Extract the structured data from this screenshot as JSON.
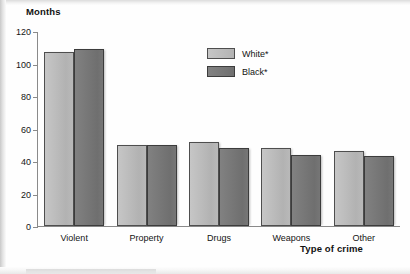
{
  "chart_data": {
    "type": "bar",
    "title": "",
    "subtitle": "",
    "ylabel": "Months",
    "xlabel": "Type of crime",
    "categories": [
      "Violent",
      "Property",
      "Drugs",
      "Weapons",
      "Other"
    ],
    "series": [
      {
        "name": "White*",
        "color": "#b9b9b9",
        "values": [
          107,
          50,
          52,
          48,
          46
        ]
      },
      {
        "name": "Black*",
        "color": "#777777",
        "values": [
          109,
          50,
          48,
          44,
          43
        ]
      }
    ],
    "ylim": [
      0,
      120
    ],
    "ytick_step": 20,
    "yticks": [
      0,
      20,
      40,
      60,
      80,
      100,
      120
    ],
    "ytick_labels": [
      "0",
      "20",
      "40",
      "60",
      "80",
      "100",
      "120"
    ],
    "grid": false,
    "legend_position": "inside-top-center"
  },
  "legend": {
    "entries": [
      {
        "label": "White*",
        "swatch": "light"
      },
      {
        "label": "Black*",
        "swatch": "dark"
      }
    ]
  },
  "axes": {
    "y_title": "Months",
    "x_title": "Type of crime"
  }
}
